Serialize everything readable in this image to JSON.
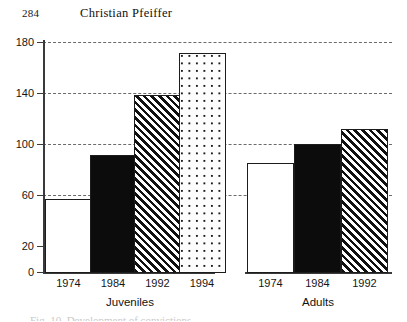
{
  "running_head": {
    "page_number": "284",
    "author": "Christian Pfeiffer"
  },
  "caption_remnant": "Fig. 10. Development of convictions",
  "colors": {
    "axis": "#3a3a3a",
    "gridline": "#6b6b6b",
    "bar_outline": "#1c1c1c",
    "bar_black": "#0c0c0c",
    "bar_white": "#ffffff",
    "text": "#161616"
  },
  "chart_data": {
    "type": "bar",
    "title": "",
    "subtitle": "",
    "xlabel": "",
    "ylabel": "",
    "ylim": [
      0,
      180
    ],
    "yticks": [
      0,
      20,
      60,
      100,
      140,
      180
    ],
    "ytick_labels": [
      "0",
      "20",
      "60",
      "100",
      "140",
      "180"
    ],
    "gridlines_at": [
      60,
      100,
      140,
      180
    ],
    "grid": true,
    "legend_position": "none",
    "groups": [
      {
        "name": "Juveniles",
        "label": "Juveniles",
        "categories": [
          "1974",
          "1984",
          "1992",
          "1994"
        ],
        "values": [
          58,
          92,
          139,
          172
        ],
        "patterns": [
          "white",
          "black",
          "hatch",
          "dots"
        ]
      },
      {
        "name": "Adults",
        "label": "Adults",
        "categories": [
          "1974",
          "1984",
          "1992"
        ],
        "values": [
          86,
          101,
          113
        ],
        "patterns": [
          "white",
          "black",
          "hatch"
        ]
      }
    ],
    "bars": [
      {
        "group": "Juveniles",
        "category": "1974",
        "value": 58,
        "pattern": "white"
      },
      {
        "group": "Juveniles",
        "category": "1984",
        "value": 92,
        "pattern": "black"
      },
      {
        "group": "Juveniles",
        "category": "1992",
        "value": 139,
        "pattern": "hatch"
      },
      {
        "group": "Juveniles",
        "category": "1994",
        "value": 172,
        "pattern": "dots"
      },
      {
        "group": "Adults",
        "category": "1974",
        "value": 86,
        "pattern": "white"
      },
      {
        "group": "Adults",
        "category": "1984",
        "value": 101,
        "pattern": "black"
      },
      {
        "group": "Adults",
        "category": "1992",
        "value": 113,
        "pattern": "hatch"
      }
    ]
  }
}
